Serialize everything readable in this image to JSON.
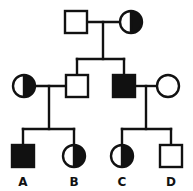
{
  "figure": {
    "kind": "pedigree-chart",
    "title": "",
    "width": 193,
    "height": 191,
    "background_color": "#ffffff",
    "line_color": "#111111",
    "fill_affected_color": "#111111",
    "fill_unaffected_color": "#ffffff",
    "stroke_width": 2.4,
    "generations": 3
  },
  "chart_data": {
    "type": "diagram",
    "title": "",
    "xlabel": "",
    "ylabel": "",
    "legend": [],
    "individuals": [
      {
        "id": "I-1",
        "generation": 1,
        "sex": "male",
        "shape": "square",
        "status": "unaffected",
        "fill": "open",
        "label": "",
        "cx": 76,
        "cy": 22,
        "size": 22
      },
      {
        "id": "I-2",
        "generation": 1,
        "sex": "female",
        "shape": "circle",
        "status": "carrier",
        "fill": "half-right",
        "label": "",
        "cx": 131,
        "cy": 22,
        "size": 22
      },
      {
        "id": "II-1",
        "generation": 2,
        "sex": "female",
        "shape": "circle",
        "status": "carrier",
        "fill": "half-right",
        "label": "",
        "cx": 24,
        "cy": 86,
        "size": 22
      },
      {
        "id": "II-2",
        "generation": 2,
        "sex": "male",
        "shape": "square",
        "status": "unaffected",
        "fill": "open",
        "label": "",
        "cx": 77,
        "cy": 86,
        "size": 22
      },
      {
        "id": "II-3",
        "generation": 2,
        "sex": "male",
        "shape": "square",
        "status": "affected",
        "fill": "solid",
        "label": "",
        "cx": 124,
        "cy": 86,
        "size": 22
      },
      {
        "id": "II-4",
        "generation": 2,
        "sex": "female",
        "shape": "circle",
        "status": "unaffected",
        "fill": "open",
        "label": "",
        "cx": 168,
        "cy": 86,
        "size": 22
      },
      {
        "id": "III-1",
        "generation": 3,
        "sex": "male",
        "shape": "square",
        "status": "affected",
        "fill": "solid",
        "label": "A",
        "cx": 23,
        "cy": 156,
        "size": 22
      },
      {
        "id": "III-2",
        "generation": 3,
        "sex": "female",
        "shape": "circle",
        "status": "carrier",
        "fill": "half-right",
        "label": "B",
        "cx": 74,
        "cy": 156,
        "size": 22
      },
      {
        "id": "III-3",
        "generation": 3,
        "sex": "female",
        "shape": "circle",
        "status": "carrier",
        "fill": "half-right",
        "label": "C",
        "cx": 122,
        "cy": 156,
        "size": 22
      },
      {
        "id": "III-4",
        "generation": 3,
        "sex": "male",
        "shape": "square",
        "status": "unaffected",
        "fill": "open",
        "label": "D",
        "cx": 171,
        "cy": 156,
        "size": 22
      }
    ],
    "matings": [
      {
        "id": "mating-I",
        "partners": [
          "I-1",
          "I-2"
        ],
        "mate_line_y": 22,
        "mate_line_x1": 87,
        "mate_line_x2": 120,
        "descent_x": 103,
        "sibship_y": 59,
        "children": [
          "II-2",
          "II-3"
        ]
      },
      {
        "id": "mating-II-left",
        "partners": [
          "II-1",
          "II-2"
        ],
        "mate_line_y": 86,
        "mate_line_x1": 35,
        "mate_line_x2": 66,
        "descent_x": 49,
        "sibship_y": 129,
        "children": [
          "III-1",
          "III-2"
        ]
      },
      {
        "id": "mating-II-right",
        "partners": [
          "II-3",
          "II-4"
        ],
        "mate_line_y": 86,
        "mate_line_x1": 135,
        "mate_line_x2": 157,
        "descent_x": 146,
        "sibship_y": 129,
        "children": [
          "III-3",
          "III-4"
        ]
      }
    ],
    "labels": [
      {
        "text": "A",
        "x": 23,
        "y": 186
      },
      {
        "text": "B",
        "x": 74,
        "y": 186
      },
      {
        "text": "C",
        "x": 122,
        "y": 186
      },
      {
        "text": "D",
        "x": 171,
        "y": 186
      }
    ]
  }
}
